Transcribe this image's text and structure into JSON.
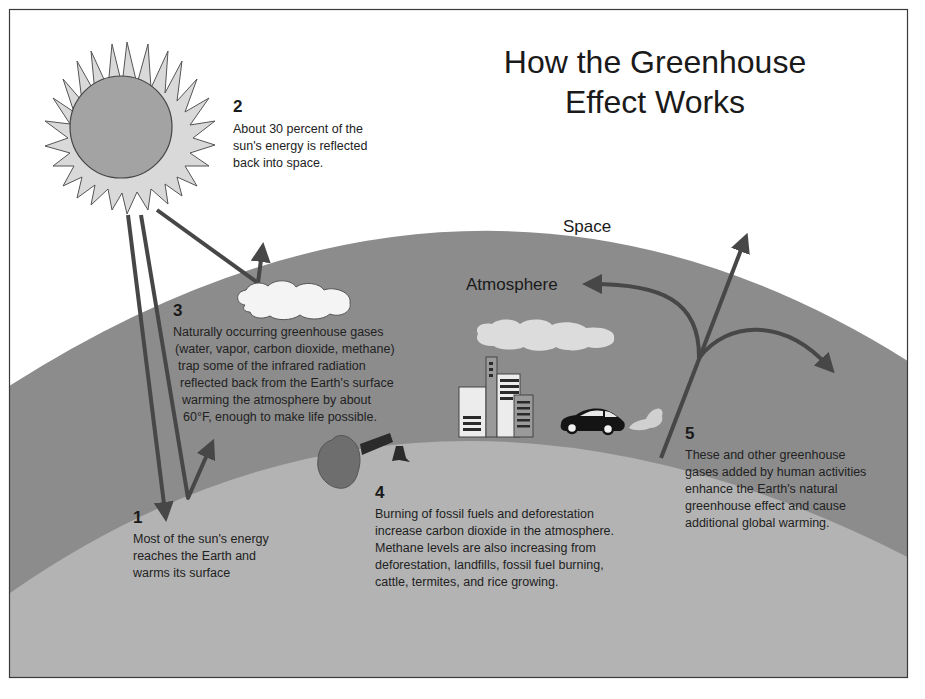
{
  "title": {
    "line1": "How the Greenhouse",
    "line2": "Effect Works"
  },
  "labels": {
    "space": "Space",
    "atmosphere": "Atmosphere"
  },
  "steps": [
    {
      "number": "1",
      "lines": [
        "Most of the sun's energy",
        "reaches the Earth and",
        "warms its surface"
      ]
    },
    {
      "number": "2",
      "lines": [
        "About 30 percent of the",
        "sun's energy is reflected",
        "back into space."
      ]
    },
    {
      "number": "3",
      "lines": [
        "Naturally occurring greenhouse gases",
        "(water, vapor, carbon dioxide, methane)",
        "trap some of the infrared radiation",
        "reflected back from the Earth's surface",
        "warming the atmosphere by about",
        "60°F, enough to make life possible."
      ]
    },
    {
      "number": "4",
      "lines": [
        "Burning of fossil fuels and deforestation",
        "increase carbon dioxide in the atmosphere.",
        "Methane levels are also increasing from",
        "deforestation, landfills, fossil fuel burning,",
        "cattle, termites, and rice growing."
      ]
    },
    {
      "number": "5",
      "lines": [
        "These and other greenhouse",
        "gases added by human activities",
        "enhance the Earth's natural",
        "greenhouse effect and cause",
        "additional global warming."
      ]
    }
  ],
  "icons": [
    "sun-icon",
    "cloud-icon",
    "city-buildings-icon",
    "car-icon",
    "exhaust-smoke-icon",
    "cut-tree-icon",
    "tree-stump-icon",
    "radiation-arrow-icon"
  ],
  "colors": {
    "space": "#ffffff",
    "atmosphere": "#8c8c8c",
    "earth": "#b3b3b3",
    "sun_rays": "#d9d9d9",
    "sun_core": "#a3a3a3",
    "arrows": "#474747",
    "cloud": "#f4f4f4",
    "frame": "#3a3a3a"
  }
}
